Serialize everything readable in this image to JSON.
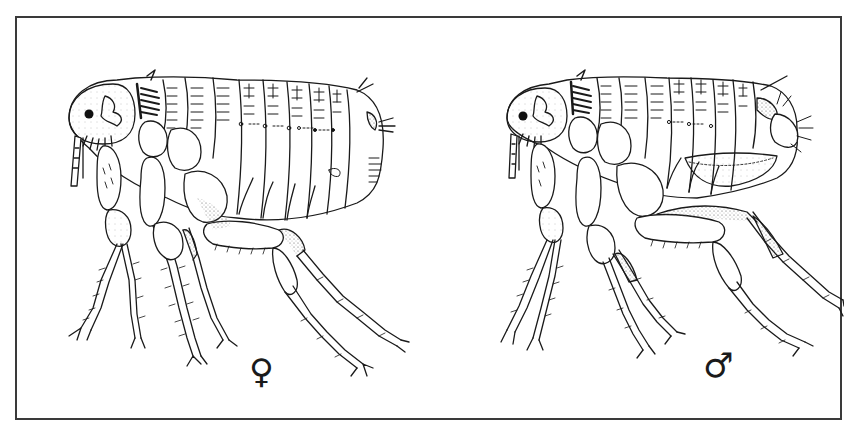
{
  "figure": {
    "type": "scientific line illustration",
    "panels": [
      {
        "id": "female",
        "sex_symbol": "♀",
        "label": "female"
      },
      {
        "id": "male",
        "sex_symbol": "♂",
        "label": "male"
      }
    ]
  },
  "colors": {
    "ink": "#1a1a1a",
    "frame": "#3a3a3a",
    "background": "#ffffff",
    "stipple": "#6a6a6a"
  }
}
